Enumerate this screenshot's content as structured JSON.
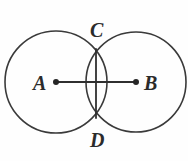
{
  "figure": {
    "background_color": "#fefefe",
    "stroke_color": "#3a3a3a",
    "label_color": "#2b2b2b",
    "width": 188,
    "height": 161
  },
  "labels": {
    "center_left": "A",
    "center_right": "B",
    "intersection_top": "C",
    "intersection_bottom": "D"
  },
  "geometry": {
    "circle_left": {
      "cx": 56,
      "cy": 82,
      "r": 51
    },
    "circle_right": {
      "cx": 136,
      "cy": 82,
      "r": 50
    },
    "segment_ab": {
      "x1": 56,
      "y1": 82,
      "x2": 136,
      "y2": 82
    },
    "segment_cd": {
      "x1": 96,
      "y1": 49,
      "x2": 96,
      "y2": 118
    },
    "point_a": {
      "cx": 56,
      "cy": 82,
      "r": 3
    },
    "point_b": {
      "cx": 136,
      "cy": 82,
      "r": 3
    },
    "label_a_pos": {
      "x": 33,
      "y": 90
    },
    "label_b_pos": {
      "x": 144,
      "y": 90
    },
    "label_c_pos": {
      "x": 90,
      "y": 37
    },
    "label_d_pos": {
      "x": 90,
      "y": 147
    }
  }
}
